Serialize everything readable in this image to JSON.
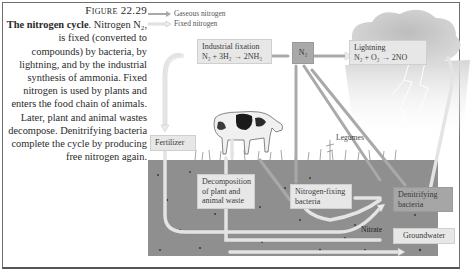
{
  "caption": {
    "figure_label": "Figure 22.29",
    "title": "The nitrogen cycle",
    "body": ". Nitrogen N₂, is fixed (converted to compounds) by bacteria, by lightning, and by the industrial synthesis of ammonia. Fixed nitrogen is used by plants and enters the food chain of animals. Later, plant and animal wastes decompose. Denitrifying bacteria complete the cycle by producing free nitrogen again."
  },
  "legend": {
    "items": [
      {
        "label": "Gaseous nitrogen",
        "color": "#a8a8a8"
      },
      {
        "label": "Fixed nitrogen",
        "color": "#e6e6e6"
      }
    ]
  },
  "nodes": {
    "industrial": {
      "title": "Industrial fixation",
      "equation": "N₂ + 3H₂ → 2NH₃"
    },
    "n2": {
      "label": "N₂"
    },
    "lightning": {
      "title": "Lightning",
      "equation": "N₂ + O₂ → 2NO"
    },
    "fertilizer": {
      "label": "Fertilizer"
    },
    "legumes": {
      "label": "Legumes"
    },
    "decomposition": {
      "label": "Decomposition of plant and animal waste"
    },
    "nitrogen_fixing": {
      "label": "Nitrogen-fixing bacteria"
    },
    "denitrifying": {
      "label": "Denitrifying bacteria"
    },
    "nitrate": {
      "label": "Nitrate"
    },
    "groundwater": {
      "label": "Groundwater"
    }
  },
  "colors": {
    "soil": "#8d8d8d",
    "gas_arrow": "#a8a8a8",
    "fixed_arrow": "#ececec",
    "cloud": "#cfcfcf"
  }
}
